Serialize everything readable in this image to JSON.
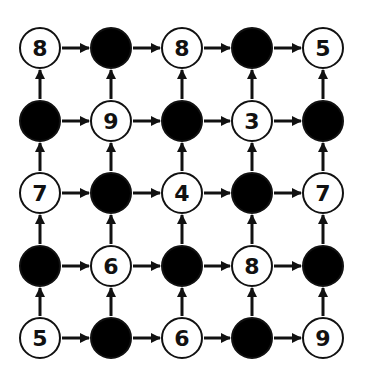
{
  "diagram": {
    "type": "grid-graph",
    "rows": 5,
    "cols": 5,
    "grid": {
      "col_x": [
        40,
        111,
        182,
        252,
        323
      ],
      "row_y": [
        48,
        121,
        193,
        266,
        338
      ],
      "radius": 20
    },
    "colors": {
      "stroke": "#111111",
      "filled": "#000000",
      "empty": "#ffffff"
    },
    "edge_direction": "right-and-up",
    "nodes": [
      [
        {
          "filled": false,
          "label": "8"
        },
        {
          "filled": true,
          "label": ""
        },
        {
          "filled": false,
          "label": "8"
        },
        {
          "filled": true,
          "label": ""
        },
        {
          "filled": false,
          "label": "5"
        }
      ],
      [
        {
          "filled": true,
          "label": ""
        },
        {
          "filled": false,
          "label": "9"
        },
        {
          "filled": true,
          "label": ""
        },
        {
          "filled": false,
          "label": "3"
        },
        {
          "filled": true,
          "label": ""
        }
      ],
      [
        {
          "filled": false,
          "label": "7"
        },
        {
          "filled": true,
          "label": ""
        },
        {
          "filled": false,
          "label": "4"
        },
        {
          "filled": true,
          "label": ""
        },
        {
          "filled": false,
          "label": "7"
        }
      ],
      [
        {
          "filled": true,
          "label": ""
        },
        {
          "filled": false,
          "label": "6"
        },
        {
          "filled": true,
          "label": ""
        },
        {
          "filled": false,
          "label": "8"
        },
        {
          "filled": true,
          "label": ""
        }
      ],
      [
        {
          "filled": false,
          "label": "5"
        },
        {
          "filled": true,
          "label": ""
        },
        {
          "filled": false,
          "label": "6"
        },
        {
          "filled": true,
          "label": ""
        },
        {
          "filled": false,
          "label": "9"
        }
      ]
    ]
  }
}
